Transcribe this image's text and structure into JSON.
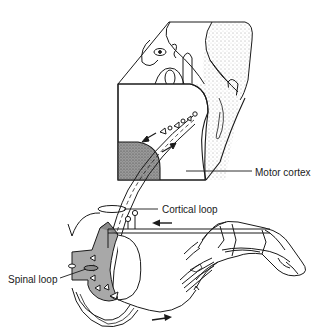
{
  "figure": {
    "type": "anatomical-diagram",
    "labels": {
      "motor_cortex": "Motor cortex",
      "cortical_loop": "Cortical loop",
      "spinal_loop": "Spinal loop"
    },
    "arrows": [
      {
        "name": "descending-arrow-cortex",
        "direction": "down-left"
      },
      {
        "name": "ascending-arrow-cortex",
        "direction": "up-right"
      },
      {
        "name": "sensory-afferent-arrow",
        "direction": "left"
      },
      {
        "name": "motor-efferent-arrow",
        "direction": "right"
      }
    ],
    "colors": {
      "line": "#1a1a1a",
      "stipple_light": "#d8d8d8",
      "stipple_dark": "#8a8a8a",
      "spinal_gray": "#a8a8a8",
      "background": "#ffffff"
    }
  }
}
